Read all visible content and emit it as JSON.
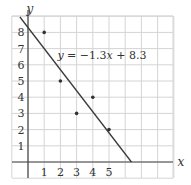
{
  "chart_data": {
    "type": "scatter",
    "title": "",
    "xlabel": "x",
    "ylabel": "y",
    "x_ticks": [
      "1",
      "2",
      "3",
      "4",
      "5"
    ],
    "y_ticks": [
      "1",
      "2",
      "3",
      "4",
      "5",
      "6",
      "7",
      "8"
    ],
    "xlim": [
      -1,
      9
    ],
    "ylim": [
      -1,
      9
    ],
    "grid": true,
    "series": [
      {
        "name": "data points",
        "type": "scatter",
        "x": [
          1,
          2,
          3,
          4,
          5
        ],
        "y": [
          8,
          5,
          3,
          4,
          2
        ]
      },
      {
        "name": "regression line",
        "type": "line",
        "slope": -1.3,
        "intercept": 8.3,
        "label": "y = −1.3x + 8.3"
      }
    ],
    "annotations": [
      {
        "text_var": "y",
        "text_rest": " = −1.3",
        "text_x": "x",
        "text_tail": " + 8.3",
        "at": [
          2,
          6.6
        ]
      }
    ]
  },
  "colors": {
    "grid": "#d4d4d4",
    "axis": "#444444",
    "line": "#3a3a3a",
    "point": "#333333"
  }
}
